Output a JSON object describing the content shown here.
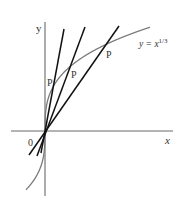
{
  "figure": {
    "colors": {
      "background": "#ffffff",
      "axes": "#6a6a6a",
      "curve": "#7a7a7a",
      "secants": "#111111",
      "text": "#333333"
    },
    "axes": {
      "x_label": "x",
      "y_label": "y",
      "origin_label": "0"
    },
    "curve": {
      "label_prefix": "y = x",
      "label_exponent": "1/3",
      "equation": "y = x^(1/3)"
    },
    "secant_lines": [
      {
        "name": "secant-1",
        "point_label": "P"
      },
      {
        "name": "secant-2",
        "point_label": "P"
      },
      {
        "name": "secant-3",
        "point_label": "P"
      }
    ]
  }
}
